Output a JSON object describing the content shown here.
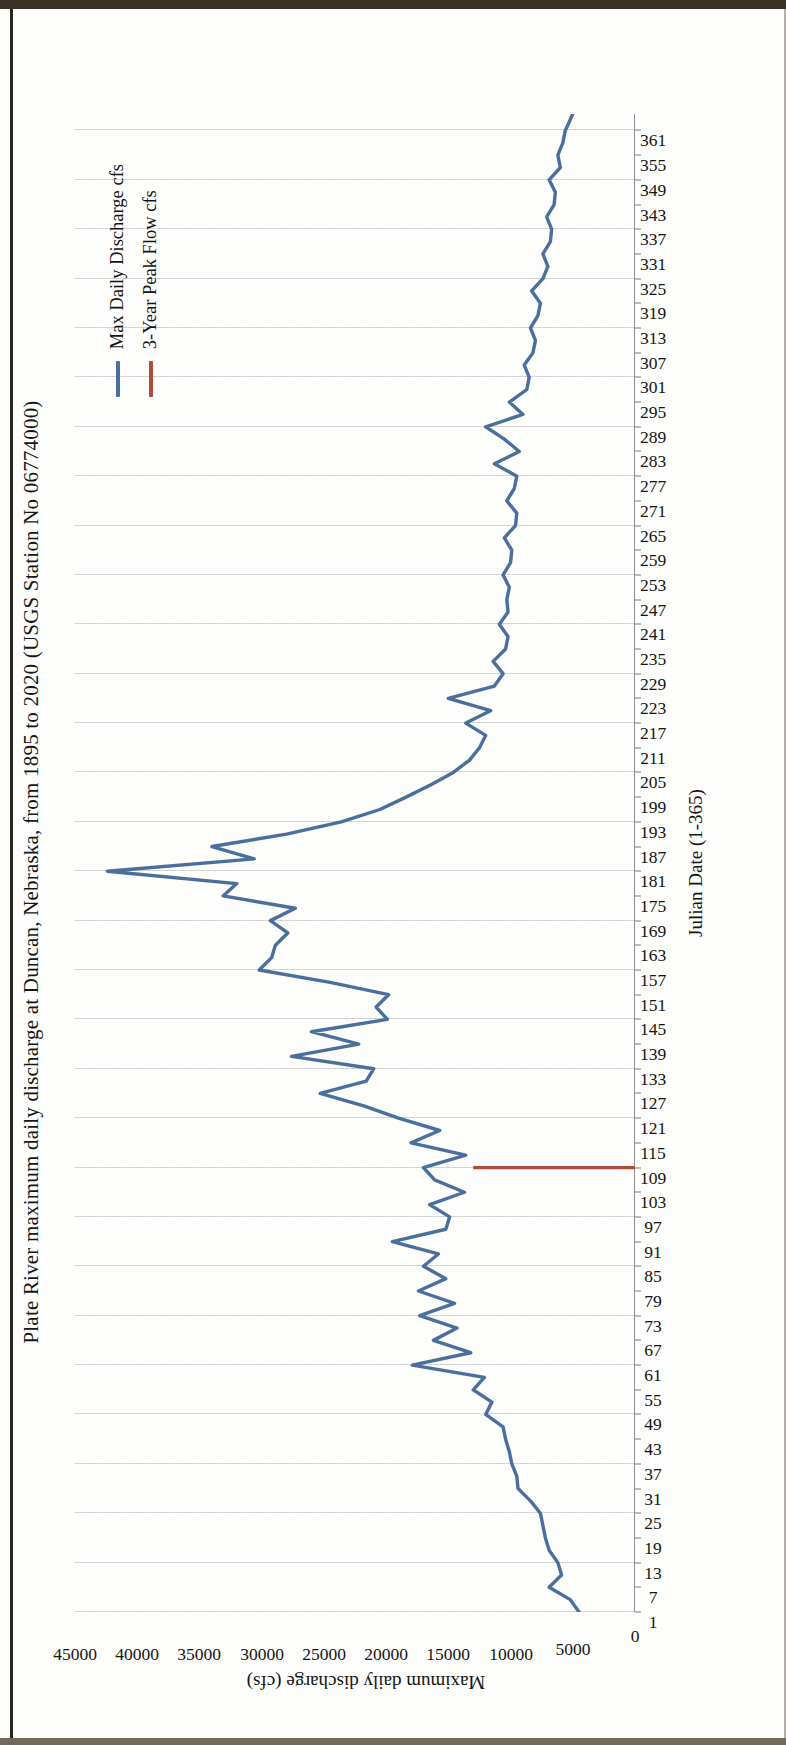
{
  "chart_data": {
    "type": "line",
    "title": "Plate River maximum daily discharge at Duncan, Nebraska, from 1895 to 2020 (USGS Station No 06774000)",
    "xlabel": "Julian Date (1-365)",
    "ylabel": "Maximum daily discharge (cfs)",
    "xlim": [
      1,
      365
    ],
    "ylim": [
      0,
      45000
    ],
    "grid": "vertical-dotted",
    "legend_position": "top-right-inside",
    "y_ticks": [
      0,
      5000,
      10000,
      15000,
      20000,
      25000,
      30000,
      35000,
      40000,
      45000
    ],
    "y_tick_labels": [
      "0",
      "5000",
      "10000",
      "15000",
      "20000",
      "25000",
      "30000",
      "35000",
      "40000",
      "45000"
    ],
    "x_ticks": [
      1,
      7,
      13,
      19,
      25,
      31,
      37,
      43,
      49,
      55,
      61,
      67,
      73,
      79,
      85,
      91,
      97,
      103,
      109,
      115,
      121,
      127,
      133,
      139,
      145,
      151,
      157,
      163,
      169,
      175,
      181,
      187,
      193,
      199,
      205,
      211,
      217,
      223,
      229,
      235,
      241,
      247,
      253,
      259,
      265,
      271,
      277,
      283,
      289,
      295,
      301,
      307,
      313,
      319,
      325,
      331,
      337,
      343,
      349,
      355,
      361
    ],
    "series": [
      {
        "name": "Max Daily Discharge cfs",
        "color": "#4a6f9c",
        "type": "line",
        "x": [
          1,
          4,
          7,
          10,
          13,
          16,
          19,
          22,
          25,
          28,
          31,
          34,
          37,
          40,
          43,
          46,
          49,
          52,
          55,
          58,
          61,
          64,
          67,
          70,
          73,
          76,
          79,
          82,
          85,
          88,
          91,
          94,
          97,
          100,
          103,
          106,
          109,
          112,
          115,
          118,
          121,
          124,
          127,
          130,
          133,
          136,
          139,
          142,
          145,
          148,
          151,
          154,
          157,
          160,
          163,
          166,
          169,
          172,
          175,
          178,
          181,
          184,
          187,
          190,
          193,
          196,
          199,
          202,
          205,
          208,
          211,
          214,
          217,
          220,
          223,
          226,
          229,
          232,
          235,
          238,
          241,
          244,
          247,
          250,
          253,
          256,
          259,
          262,
          265,
          268,
          271,
          274,
          277,
          280,
          283,
          286,
          289,
          292,
          295,
          298,
          301,
          304,
          307,
          310,
          313,
          316,
          319,
          322,
          325,
          328,
          331,
          334,
          337,
          340,
          343,
          346,
          349,
          352,
          355,
          358,
          361,
          365
        ],
        "y": [
          4500,
          5200,
          6900,
          5900,
          6200,
          6900,
          7200,
          7400,
          7600,
          8400,
          9400,
          9500,
          9900,
          10100,
          10400,
          10600,
          12000,
          11500,
          13000,
          12100,
          17900,
          13200,
          16200,
          14300,
          17300,
          14500,
          17400,
          15200,
          17000,
          15800,
          19500,
          15200,
          14900,
          16500,
          13700,
          16100,
          17000,
          13600,
          18000,
          15700,
          19000,
          21800,
          25300,
          21600,
          21000,
          27600,
          22200,
          26000,
          19900,
          20800,
          19800,
          24500,
          30200,
          29200,
          28900,
          27900,
          29300,
          27300,
          33100,
          32000,
          42400,
          30600,
          34000,
          28000,
          23600,
          20500,
          18400,
          16400,
          14600,
          13300,
          12500,
          12000,
          13600,
          11600,
          15000,
          11300,
          10600,
          11400,
          10400,
          10200,
          10900,
          10200,
          10300,
          10100,
          10600,
          10000,
          9900,
          10500,
          9600,
          9500,
          10300,
          9700,
          9500,
          11300,
          9300,
          10500,
          12000,
          9000,
          10100,
          8700,
          8500,
          8900,
          8200,
          8000,
          8400,
          7800,
          7600,
          8300,
          7400,
          7000,
          7400,
          6800,
          6700,
          7100,
          6500,
          6400,
          6900,
          6000,
          6200,
          5800,
          5600,
          5000
        ]
      },
      {
        "name": "3-Year Peak Flow cfs",
        "color": "#b04a3a",
        "type": "vline",
        "x": 109,
        "y_from": 0,
        "y_to": 13000,
        "value": 13000
      }
    ]
  },
  "legend": {
    "items": [
      {
        "label": "Max Daily Discharge cfs",
        "color": "#4a6f9c"
      },
      {
        "label": "3-Year Peak Flow cfs",
        "color": "#b04a3a"
      }
    ]
  }
}
